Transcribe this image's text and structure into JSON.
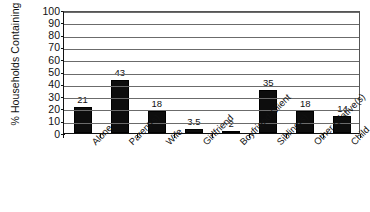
{
  "chart_data": {
    "type": "bar",
    "title": "",
    "subtitle": "",
    "xlabel": "",
    "ylabel": "% Households Containing",
    "ylim": [
      0,
      100
    ],
    "ytick_step": 10,
    "yticks": [
      "100",
      "90",
      "80",
      "70",
      "60",
      "50",
      "40",
      "30",
      "20",
      "10",
      "0"
    ],
    "grid": "horizontal",
    "legend": "none",
    "bar_color": "#0d0d0d",
    "categories": [
      "Alone",
      "Parent(s)",
      "Wife",
      "Girlfriend",
      "Boyfriend-Client",
      "Sibling(s)",
      "Other relative(s)",
      "Child"
    ],
    "values": [
      21,
      43,
      18,
      3.5,
      2,
      35,
      18,
      14
    ],
    "value_labels": [
      "21",
      "43",
      "18",
      "3.5",
      "2",
      "35",
      "18",
      "14"
    ]
  }
}
